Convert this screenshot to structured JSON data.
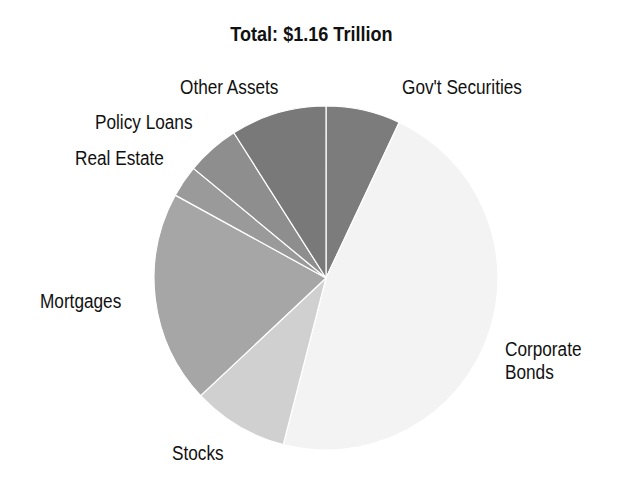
{
  "chart_data": {
    "type": "pie",
    "title": "Total: $1.16 Trillion",
    "start_angle_deg": 0,
    "direction": "clockwise",
    "slices": [
      {
        "label": "Gov't Securities",
        "value": 7,
        "color": "#7c7c7c",
        "label_pos": [
          402,
          76
        ]
      },
      {
        "label": "Corporate Bonds",
        "value": 47,
        "color": "#f3f3f3",
        "label_pos": [
          505,
          338
        ],
        "label_lines": [
          "Corporate",
          "Bonds"
        ]
      },
      {
        "label": "Stocks",
        "value": 9,
        "color": "#d0d0d0",
        "label_pos": [
          172,
          442
        ]
      },
      {
        "label": "Mortgages",
        "value": 20,
        "color": "#a6a6a6",
        "label_pos": [
          40,
          290
        ]
      },
      {
        "label": "Real Estate",
        "value": 3,
        "color": "#9a9a9a",
        "label_pos": [
          75,
          147
        ]
      },
      {
        "label": "Policy Loans",
        "value": 5,
        "color": "#8e8e8e",
        "label_pos": [
          95,
          111
        ]
      },
      {
        "label": "Other Assets",
        "value": 9,
        "color": "#797979",
        "label_pos": [
          180,
          76
        ]
      }
    ],
    "units": "percent (estimated)"
  }
}
